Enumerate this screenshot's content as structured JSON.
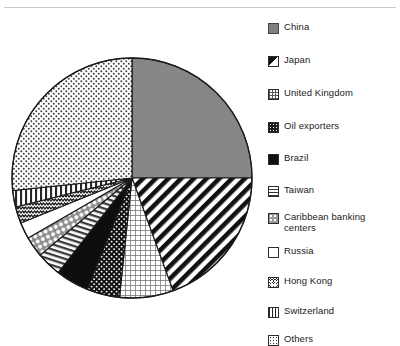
{
  "figure": {
    "background": "#ffffff",
    "outline_color": "#1a1a1a"
  },
  "legend": {
    "position": "right",
    "items": [
      {
        "label": "China",
        "pattern": "solid-gray",
        "swatch_name": "legend-swatch-china"
      },
      {
        "label": "Japan",
        "pattern": "diagonal",
        "swatch_name": "legend-swatch-japan"
      },
      {
        "label": "United Kingdom",
        "pattern": "fine-grid",
        "swatch_name": "legend-swatch-united-kingdom"
      },
      {
        "label": "Oil exporters",
        "pattern": "dark-dots",
        "swatch_name": "legend-swatch-oil-exporters"
      },
      {
        "label": "Brazil",
        "pattern": "solid-black",
        "swatch_name": "legend-swatch-brazil"
      },
      {
        "label": "Taiwan",
        "pattern": "horizontal",
        "swatch_name": "legend-swatch-taiwan"
      },
      {
        "label": "Caribbean banking\ncenters",
        "pattern": "checker",
        "swatch_name": "legend-swatch-caribbean-banking-centers"
      },
      {
        "label": "Russia",
        "pattern": "white",
        "swatch_name": "legend-swatch-russia"
      },
      {
        "label": "Hong Kong",
        "pattern": "wave",
        "swatch_name": "legend-swatch-hong-kong"
      },
      {
        "label": "Switzerland",
        "pattern": "vertical",
        "swatch_name": "legend-swatch-switzerland"
      },
      {
        "label": "Others",
        "pattern": "dots",
        "swatch_name": "legend-swatch-others"
      }
    ]
  },
  "chart_data": {
    "type": "pie",
    "title": "",
    "start_angle_deg": 0,
    "direction": "clockwise",
    "center_px": [
      132,
      178
    ],
    "radius_px": 120,
    "categories": [
      "China",
      "Japan",
      "United Kingdom",
      "Oil exporters",
      "Brazil",
      "Taiwan",
      "Caribbean banking centers",
      "Russia",
      "Hong Kong",
      "Switzerland",
      "Others"
    ],
    "values": [
      25.0,
      19.4,
      7.2,
      4.4,
      4.4,
      3.3,
      2.8,
      2.2,
      2.2,
      2.2,
      26.9
    ],
    "unit": "percent",
    "angles_deg": [
      {
        "name": "China",
        "start": 0.0,
        "end": 90.0
      },
      {
        "name": "Japan",
        "start": 90.0,
        "end": 160.0
      },
      {
        "name": "United Kingdom",
        "start": 160.0,
        "end": 186.0
      },
      {
        "name": "Oil exporters",
        "start": 186.0,
        "end": 202.0
      },
      {
        "name": "Brazil",
        "start": 202.0,
        "end": 218.0
      },
      {
        "name": "Taiwan",
        "start": 218.0,
        "end": 230.0
      },
      {
        "name": "Caribbean banking centers",
        "start": 230.0,
        "end": 240.0
      },
      {
        "name": "Russia",
        "start": 240.0,
        "end": 248.0
      },
      {
        "name": "Hong Kong",
        "start": 248.0,
        "end": 256.0
      },
      {
        "name": "Switzerland",
        "start": 256.0,
        "end": 264.0
      },
      {
        "name": "Others",
        "start": 264.0,
        "end": 360.0
      }
    ],
    "legend_position": "right",
    "grid": false
  }
}
